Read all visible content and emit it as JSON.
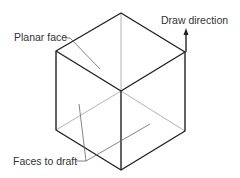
{
  "diagram": {
    "labels": {
      "planar_face": "Planar face",
      "draw_direction": "Draw direction",
      "faces_to_draft": "Faces to draft"
    },
    "colors": {
      "edge": "#222222",
      "hidden_edge": "#999999",
      "leader": "#666666",
      "text": "#333333"
    }
  }
}
